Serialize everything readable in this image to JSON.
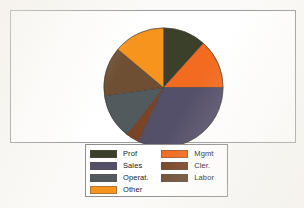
{
  "chart_data": {
    "type": "pie",
    "title": "",
    "categories": [
      "Prof",
      "Mgmt",
      "Sales",
      "Cler.",
      "Operat.",
      "Labor",
      "Other"
    ],
    "values": [
      11.7,
      13.3,
      31.9,
      3.6,
      12.2,
      13.3,
      14.0
    ],
    "units": "percent",
    "start_angle_deg": 0,
    "direction": "clockwise",
    "legend_position": "bottom",
    "grid": false,
    "slices": [
      {
        "label": "Prof",
        "value": 11.7,
        "color": "#3a4029",
        "start_deg": 0,
        "end_deg": 42
      },
      {
        "label": "Mgmt",
        "value": 13.3,
        "color": "#f26b21",
        "start_deg": 42,
        "end_deg": 90
      },
      {
        "label": "Sales",
        "value": 31.9,
        "color": "#55506a",
        "start_deg": 90,
        "end_deg": 205
      },
      {
        "label": "Cler.",
        "value": 3.6,
        "color": "#7a4428",
        "start_deg": 205,
        "end_deg": 218
      },
      {
        "label": "Operat.",
        "value": 12.2,
        "color": "#525a5e",
        "start_deg": 218,
        "end_deg": 262
      },
      {
        "label": "Labor",
        "value": 13.3,
        "color": "#6e4f33",
        "start_deg": 262,
        "end_deg": 310
      },
      {
        "label": "Other",
        "value": 14.0,
        "color": "#f7941e",
        "start_deg": 310,
        "end_deg": 360
      }
    ]
  },
  "legend": {
    "left_column": [
      {
        "label": "Prof",
        "color": "#3a4029"
      },
      {
        "label": "Sales",
        "color": "#55506a"
      },
      {
        "label": "Operat.",
        "color": "#525a5e"
      },
      {
        "label": "Other",
        "color": "#f7941e"
      }
    ],
    "right_column": [
      {
        "label": "Mgmt",
        "color": "#f26b21"
      },
      {
        "label": "Cler.",
        "color": "#7a4428"
      },
      {
        "label": "Labor",
        "color": "#6e4f33"
      }
    ]
  },
  "colors": {
    "background": "#fbfaf8",
    "panel_background": "#ffffff",
    "panel_border": "#9a9a9a",
    "legend_border": "#8f8f8f",
    "text": "#1b1b1b"
  }
}
